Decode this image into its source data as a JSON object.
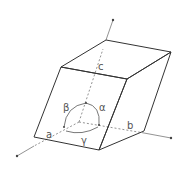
{
  "diagram": {
    "colors": {
      "edge": "#333333",
      "axis": "#777777",
      "label": "#555555",
      "background": "#ffffff"
    },
    "labels": {
      "c": "c",
      "a": "a",
      "b": "b",
      "alpha": "α",
      "beta": "β",
      "gamma": "γ"
    },
    "axes": [
      {
        "name": "a",
        "from": [
          79,
          122
        ],
        "to": [
          17,
          156
        ]
      },
      {
        "name": "b",
        "from": [
          79,
          122
        ],
        "to": [
          171,
          138
        ]
      },
      {
        "name": "c",
        "from": [
          79,
          122
        ],
        "to": [
          113,
          20
        ]
      }
    ],
    "angles": [
      {
        "name": "alpha",
        "between": [
          "b",
          "c"
        ]
      },
      {
        "name": "beta",
        "between": [
          "a",
          "c"
        ]
      },
      {
        "name": "gamma",
        "between": [
          "a",
          "b"
        ]
      }
    ]
  }
}
